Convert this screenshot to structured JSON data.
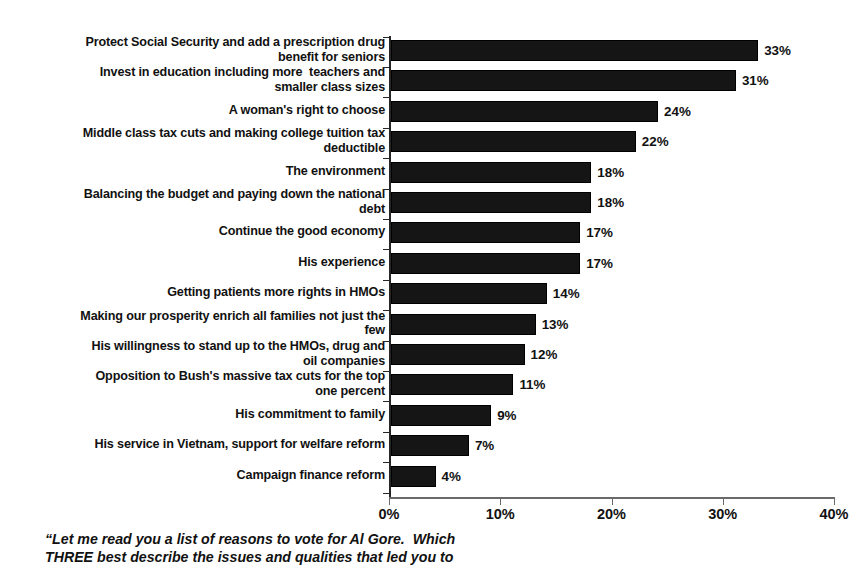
{
  "chart_data": {
    "type": "bar",
    "orientation": "horizontal",
    "title": "",
    "subtitle": "",
    "xlabel": "",
    "ylabel": "",
    "xlim": [
      0,
      40
    ],
    "xticks": [
      "0%",
      "10%",
      "20%",
      "30%",
      "40%"
    ],
    "xtick_values": [
      0,
      10,
      20,
      30,
      40
    ],
    "grid": false,
    "legend": false,
    "value_label_suffix": "%",
    "bar_color": "#151515",
    "categories": [
      "Protect Social Security and add a prescription drug benefit for seniors",
      "Invest in education including more  teachers and smaller class sizes",
      "A woman's right to choose",
      "Middle class tax cuts and making college tuition tax deductible",
      "The environment",
      "Balancing the budget and paying down the national debt",
      "Continue the good economy",
      "His experience",
      "Getting patients more rights in HMOs",
      "Making our prosperity enrich all families not just the few",
      "His willingness to stand up to the HMOs, drug and oil companies",
      "Opposition to Bush's massive tax cuts for the top one percent",
      "His commitment to family",
      "His service in Vietnam, support for welfare reform",
      "Campaign finance reform"
    ],
    "values": [
      33,
      31,
      24,
      22,
      18,
      18,
      17,
      17,
      14,
      13,
      12,
      11,
      9,
      7,
      4
    ],
    "value_labels": [
      "33%",
      "31%",
      "24%",
      "22%",
      "18%",
      "18%",
      "17%",
      "17%",
      "14%",
      "13%",
      "12%",
      "11%",
      "9%",
      "7%",
      "4%"
    ],
    "category_lines": [
      [
        "Protect Social Security and add a prescription drug",
        "benefit for seniors"
      ],
      [
        "Invest in education including more  teachers and",
        "smaller class sizes"
      ],
      [
        "A woman's right to choose"
      ],
      [
        "Middle class tax cuts and making college tuition tax",
        "deductible"
      ],
      [
        "The environment"
      ],
      [
        "Balancing the budget and paying down the national",
        "debt"
      ],
      [
        "Continue the good economy"
      ],
      [
        "His experience"
      ],
      [
        "Getting patients more rights in HMOs"
      ],
      [
        "Making our prosperity enrich all families not just the",
        "few"
      ],
      [
        "His willingness to stand up to the HMOs, drug and",
        "oil companies"
      ],
      [
        "Opposition to Bush's massive tax cuts for the top",
        "one percent"
      ],
      [
        "His commitment to family"
      ],
      [
        "His service in Vietnam, support for welfare reform"
      ],
      [
        "Campaign finance reform"
      ]
    ]
  },
  "caption": {
    "lines": [
      "“Let me read you a list of reasons to vote for Al Gore.  Which",
      "THREE best describe the issues and qualities that led you to"
    ]
  }
}
